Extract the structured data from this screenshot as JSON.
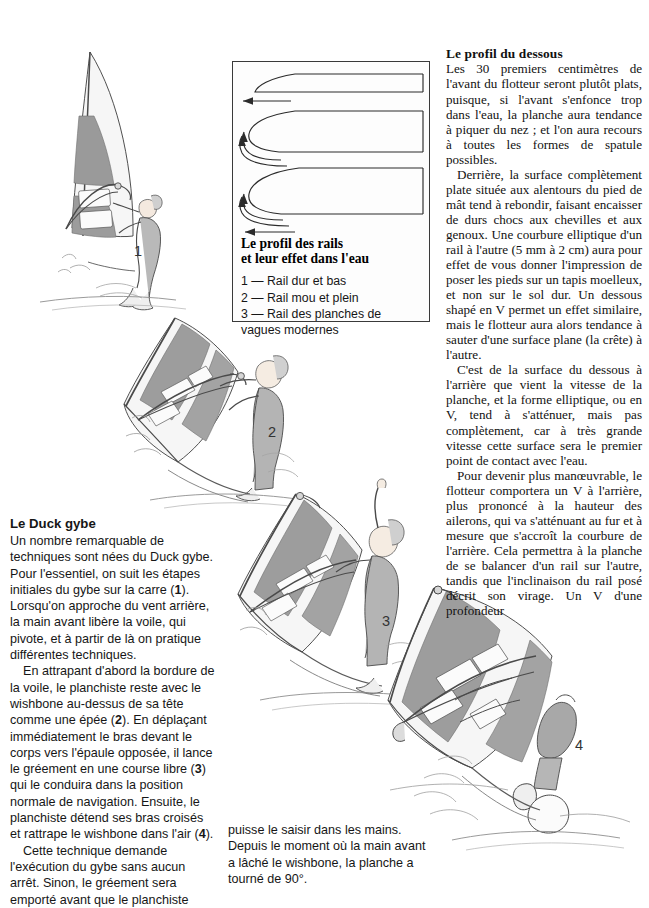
{
  "page": {
    "language": "fr",
    "width": 649,
    "height": 885,
    "background": "#ffffff",
    "ink": "#1a1a1a"
  },
  "right_column": {
    "heading": "Le profil du dessous",
    "paragraphs": [
      "Les 30 premiers centimètres de l'avant du flotteur seront plutôt plats, puisque, si l'avant s'enfonce trop dans l'eau, la planche aura tendance à piquer du nez ; et l'on aura recours à toutes les formes de spatule possibles.",
      "Derrière, la surface complètement plate située aux alentours du pied de mât tend à rebondir, faisant encaisser de durs chocs aux chevilles et aux genoux. Une courbure elliptique d'un rail à l'autre (5 mm à 2 cm) aura pour effet de vous donner l'impression de poser les pieds sur un tapis moelleux, et non sur le sol dur. Un dessous shapé en V permet un effet similaire, mais le flotteur aura alors tendance à sauter d'une surface plane (la crête) à l'autre.",
      "C'est de la surface du dessous à l'arrière que vient la vitesse de la planche, et la forme elliptique, ou en V, tend à s'atténuer, mais pas complètement, car à très grande vitesse cette surface sera le premier point de contact avec l'eau.",
      "Pour devenir plus manœuvrable, le flotteur comportera un V à l'arrière, plus prononcé à la hauteur des ailerons, qui va s'atténuant au fur et à mesure que s'accroît la courbure de l'arrière. Cela permettra à la planche de se balancer d'un rail sur l'autre, tandis que l'inclinaison du rail posé décrit son virage. Un V d'une profondeur"
    ]
  },
  "left_column": {
    "heading": "Le Duck gybe",
    "paragraph_1_a": "Un nombre remarquable de techniques sont nées du Duck gybe. Pour l'essentiel, on suit les étapes initiales du gybe sur la carre (",
    "paragraph_1_marker": "1",
    "paragraph_1_b": "). Lorsqu'on approche du vent arrière, la main avant libère la voile, qui pivote, et à partir de là on pratique différentes techniques.",
    "paragraph_2_a": "En attrapant d'abord la bordure de la voile, le planchiste reste avec le wishbone au-dessus de sa tête comme une épée (",
    "paragraph_2_marker": "2",
    "paragraph_2_b": "). En déplaçant immédiatement le bras devant le corps vers l'épaule opposée, il lance le gréement en une course libre (",
    "paragraph_2_marker_b": "3",
    "paragraph_2_c": ") qui le conduira dans la position normale de navigation. Ensuite, le planchiste détend ses bras croisés et rattrape le wishbone dans l'air (",
    "paragraph_2_marker_c": "4",
    "paragraph_2_d": ").",
    "paragraph_3": "Cette technique demande l'exécution du gybe sans aucun arrêt. Sinon, le gréement sera emporté avant que le planchiste"
  },
  "bottom_column": {
    "paragraph": "puisse le saisir dans les mains. Depuis le moment où la main avant a lâché le wishbone, la planche a tourné de 90°."
  },
  "rail_figure": {
    "caption_line_1": "Le profil des rails",
    "caption_line_2": "et leur effet dans l'eau",
    "legend": [
      "1 — Rail dur et bas",
      "2 — Rail mou et plein",
      "3 — Rail des planches de",
      "vagues modernes"
    ],
    "border_color": "#3a3a3a"
  },
  "figure_labels": [
    {
      "id": "fig-1",
      "text": "1",
      "x": 134,
      "y": 243
    },
    {
      "id": "fig-2",
      "text": "2",
      "x": 268,
      "y": 424
    },
    {
      "id": "fig-3",
      "text": "3",
      "x": 382,
      "y": 613
    },
    {
      "id": "fig-4",
      "text": "4",
      "x": 575,
      "y": 737
    }
  ],
  "illustration": {
    "description": "Four-step windsurfing duck gybe sequence, pencil-style line drawings",
    "sail_panel_gray": "#9a9a9a",
    "sail_panel_light": "#ececec",
    "outline": "#3c3c3c",
    "water_line": "#7a7a7a"
  }
}
